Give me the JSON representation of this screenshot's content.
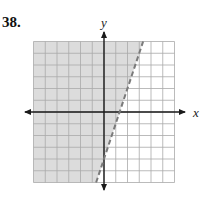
{
  "problem": {
    "number_label": "38."
  },
  "colors": {
    "shade": "#dcdcdc",
    "grid": "#a9a9a9",
    "axis": "#1a1a1a",
    "boundary": "#7a7a7a",
    "background": "#ffffff"
  },
  "chart_data": {
    "type": "area",
    "title": "",
    "xlabel": "x",
    "ylabel": "y",
    "xlim": [
      -6,
      6
    ],
    "ylim": [
      -6,
      6
    ],
    "grid": true,
    "grid_step": 1,
    "tick_labels": false,
    "legend": null,
    "boundary_line": {
      "equation": "y = 3x - 4",
      "slope": 3,
      "intercept": -4,
      "style": "dashed",
      "points": [
        [
          -0.67,
          -6
        ],
        [
          3.33,
          6
        ]
      ]
    },
    "inequality": "y > 3x - 4",
    "shaded_region": "left/above the boundary line",
    "axis_labels": {
      "x": "x",
      "y": "y"
    }
  }
}
